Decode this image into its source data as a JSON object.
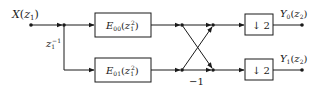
{
  "diagram": {
    "type": "polyphase-filter-bank",
    "input": {
      "label": "X",
      "arg": "z",
      "arg_sub": "1"
    },
    "delay": {
      "base": "z",
      "sub": "1",
      "sup": "−1"
    },
    "filters": [
      {
        "id": "E00",
        "name": "E",
        "sub": "00",
        "arg": "z",
        "arg_sub": "1",
        "arg_sup": "2"
      },
      {
        "id": "E01",
        "name": "E",
        "sub": "01",
        "arg": "z",
        "arg_sub": "1",
        "arg_sup": "2"
      }
    ],
    "butterfly": {
      "gain_label": "−1"
    },
    "downsamplers": [
      {
        "label": "↓ 2"
      },
      {
        "label": "↓ 2"
      }
    ],
    "outputs": [
      {
        "label": "Y",
        "sub": "0",
        "arg": "z",
        "arg_sub": "2"
      },
      {
        "label": "Y",
        "sub": "1",
        "arg": "z",
        "arg_sub": "2"
      }
    ],
    "colors": {
      "stroke": "#1a1a1a",
      "background": "#ffffff"
    }
  }
}
